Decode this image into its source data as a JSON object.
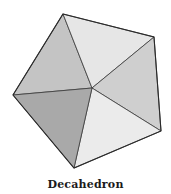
{
  "figure": {
    "caption": "Decahedron",
    "shape": "pentagonal-bipyramid",
    "vertices": {
      "center": [
        92,
        88
      ],
      "top": [
        63,
        14
      ],
      "right_top": [
        154,
        37
      ],
      "right_bottom": [
        161,
        131
      ],
      "bottom": [
        74,
        168
      ],
      "left": [
        13,
        95
      ]
    },
    "faces": [
      {
        "name": "face-top-left",
        "color": "#c4c4c4"
      },
      {
        "name": "face-top-right",
        "color": "#e6e6e6"
      },
      {
        "name": "face-right",
        "color": "#cfcfcf"
      },
      {
        "name": "face-bottom-right",
        "color": "#ebebeb"
      },
      {
        "name": "face-bottom-left",
        "color": "#a9a9a9"
      }
    ],
    "edge_color": "#3a3a3a"
  }
}
